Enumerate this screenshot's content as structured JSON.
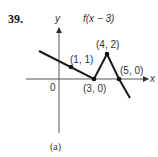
{
  "problem_number": "39.",
  "title": "f(x − 3)",
  "axes": {
    "x_label": "x",
    "y_label": "y",
    "origin_label": "0"
  },
  "points": [
    {
      "label": "(1, 1)",
      "x": 1,
      "y": 1
    },
    {
      "label": "(3, 0)",
      "x": 3,
      "y": 0
    },
    {
      "label": "(4, 2)",
      "x": 4,
      "y": 2
    },
    {
      "label": "(5, 0)",
      "x": 5,
      "y": 0
    }
  ],
  "caption": "(a)",
  "colors": {
    "line": "#1a1a1a",
    "axis": "#333333"
  }
}
